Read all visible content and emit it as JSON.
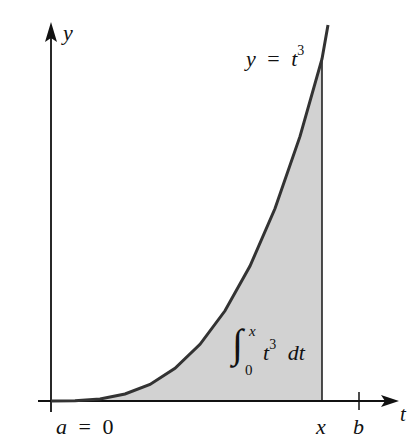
{
  "figure": {
    "y_axis_label": "y",
    "x_axis_label": "t",
    "curve_label_lhs": "y",
    "curve_label_eq": "=",
    "curve_label_base": "t",
    "curve_label_exp": "3",
    "integral_upper": "x",
    "integral_lower": "0",
    "integral_base": "t",
    "integral_exp": "3",
    "integral_dt": "dt",
    "tick_a_label": "a",
    "tick_a_eq": "=",
    "tick_a_value": "0",
    "tick_x_label": "x",
    "tick_b_label": "b",
    "colors": {
      "axis": "#111111",
      "curve": "#333333",
      "shade": "#d2d2d2"
    }
  }
}
